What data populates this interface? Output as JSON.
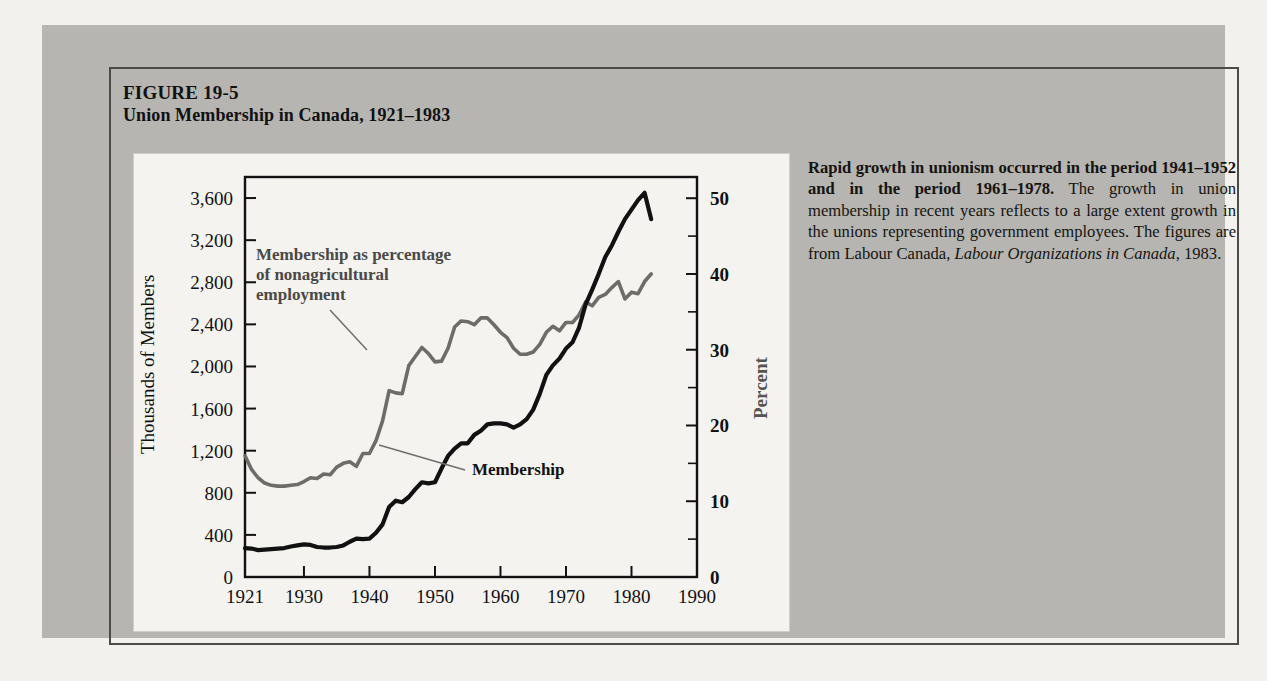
{
  "figure": {
    "number": "FIGURE 19-5",
    "title": "Union Membership in Canada, 1921–1983",
    "caption_bold": "Rapid growth in unionism occurred in the period 1941–1952 and in the period 1961–1978.",
    "caption_rest_1": " The growth in union membership in recent years reflects to a large extent growth in the unions representing government employees. The figures are from Labour Canada, ",
    "caption_italic": "Labour Organizations in Canada",
    "caption_rest_2": ", 1983."
  },
  "chart_data": {
    "type": "line",
    "title": "Union Membership in Canada, 1921–1983",
    "xlabel": "",
    "ylabel": "Thousands of Members",
    "ylabel_right": "Percent",
    "xlim": [
      1921,
      1990
    ],
    "ylim": [
      0,
      3800
    ],
    "ylim_right": [
      0,
      52.8
    ],
    "grid": false,
    "legend": "annotations",
    "xticks": [
      1921,
      1930,
      1940,
      1950,
      1960,
      1970,
      1980,
      1990
    ],
    "xtick_labels": [
      "1921",
      "1930",
      "1940",
      "1950",
      "1960",
      "1970",
      "1980",
      "1990"
    ],
    "yticks": [
      0,
      400,
      800,
      1200,
      1600,
      2000,
      2400,
      2800,
      3200,
      3600
    ],
    "ytick_labels": [
      "0",
      "400",
      "800",
      "1,200",
      "1,600",
      "2,000",
      "2,400",
      "2,800",
      "3,200",
      "3,600"
    ],
    "yticks_right": [
      0,
      10,
      20,
      30,
      40,
      50
    ],
    "ytick_labels_right": [
      "0",
      "10",
      "20",
      "30",
      "40",
      "50"
    ],
    "yticks_right_minor": [
      5,
      15,
      25,
      35,
      45
    ],
    "annotations": [
      {
        "name": "percent-series-label",
        "lines": [
          "Membership as percentage",
          "of nonagricultural",
          "employment"
        ]
      },
      {
        "name": "membership-series-label",
        "lines": [
          "Membership"
        ]
      }
    ],
    "series": [
      {
        "name": "Membership",
        "units": "thousands of members",
        "axis": "left",
        "color": "#111111",
        "x": [
          1921,
          1922,
          1923,
          1924,
          1925,
          1926,
          1927,
          1928,
          1929,
          1930,
          1931,
          1932,
          1933,
          1934,
          1935,
          1936,
          1937,
          1938,
          1939,
          1940,
          1941,
          1942,
          1943,
          1944,
          1945,
          1946,
          1947,
          1948,
          1949,
          1950,
          1951,
          1952,
          1953,
          1954,
          1955,
          1956,
          1957,
          1958,
          1959,
          1960,
          1961,
          1962,
          1963,
          1964,
          1965,
          1966,
          1967,
          1968,
          1969,
          1970,
          1971,
          1972,
          1973,
          1974,
          1975,
          1976,
          1977,
          1978,
          1979,
          1980,
          1981,
          1982,
          1983
        ],
        "y": [
          275,
          270,
          255,
          260,
          265,
          270,
          275,
          290,
          300,
          310,
          305,
          285,
          280,
          280,
          285,
          300,
          335,
          365,
          360,
          365,
          420,
          500,
          665,
          725,
          710,
          760,
          835,
          900,
          890,
          900,
          1030,
          1150,
          1220,
          1270,
          1270,
          1350,
          1390,
          1450,
          1460,
          1460,
          1450,
          1420,
          1450,
          1500,
          1590,
          1740,
          1920,
          2010,
          2075,
          2170,
          2230,
          2370,
          2590,
          2730,
          2880,
          3040,
          3150,
          3280,
          3400,
          3490,
          3580,
          3650,
          3400
        ]
      },
      {
        "name": "Membership as percentage of nonagricultural employment",
        "units": "percent",
        "axis": "right",
        "color": "#6d6c69",
        "x": [
          1921,
          1922,
          1923,
          1924,
          1925,
          1926,
          1927,
          1928,
          1929,
          1930,
          1931,
          1932,
          1933,
          1934,
          1935,
          1936,
          1937,
          1938,
          1939,
          1940,
          1941,
          1942,
          1943,
          1944,
          1945,
          1946,
          1947,
          1948,
          1949,
          1950,
          1951,
          1952,
          1953,
          1954,
          1955,
          1956,
          1957,
          1958,
          1959,
          1960,
          1961,
          1962,
          1963,
          1964,
          1965,
          1966,
          1967,
          1968,
          1969,
          1970,
          1971,
          1972,
          1973,
          1974,
          1975,
          1976,
          1977,
          1978,
          1979,
          1980,
          1981,
          1982,
          1983
        ],
        "y": [
          16.0,
          14.2,
          13.1,
          12.4,
          12.1,
          12.0,
          12.0,
          12.1,
          12.2,
          12.6,
          13.1,
          13.0,
          13.6,
          13.5,
          14.5,
          15.0,
          15.2,
          14.6,
          16.3,
          16.3,
          18.0,
          20.6,
          24.6,
          24.3,
          24.2,
          27.9,
          29.1,
          30.3,
          29.5,
          28.4,
          28.5,
          30.2,
          33.0,
          33.8,
          33.7,
          33.3,
          34.2,
          34.2,
          33.3,
          32.3,
          31.6,
          30.2,
          29.4,
          29.4,
          29.7,
          30.7,
          32.3,
          33.1,
          32.5,
          33.6,
          33.6,
          34.6,
          36.3,
          35.8,
          36.9,
          37.3,
          38.2,
          39.0,
          36.7,
          37.6,
          37.4,
          39.0,
          40.0
        ]
      }
    ]
  }
}
